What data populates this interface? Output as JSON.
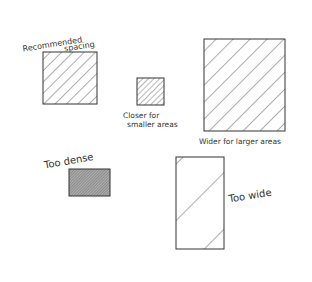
{
  "diagram": {
    "labels": {
      "recommended_line1": "Recommended",
      "recommended_line2": "spacing",
      "closer_line1": "Closer for",
      "closer_line2": "smaller areas",
      "wider": "Wider for larger areas",
      "too_dense": "Too dense",
      "too_wide": "Too wide"
    },
    "colors": {
      "stroke": "#333333",
      "background": "#ffffff",
      "dense_fill": "#9a9a9a"
    }
  }
}
